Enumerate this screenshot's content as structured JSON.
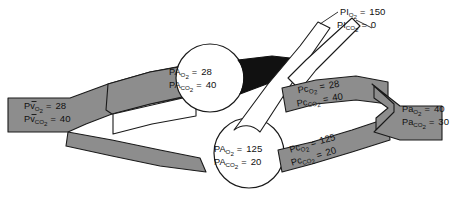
{
  "figure": {
    "colors": {
      "vessel_gray": "#8d8d8d",
      "vessel_gray_dark": "#777777",
      "airway_white": "#ffffff",
      "airway_blocked_black": "#111111",
      "outline": "#1a1a1a",
      "background": "#ffffff"
    }
  },
  "labels": {
    "inspired": {
      "name": "inspired-gas",
      "lines": [
        {
          "symbol": "PI",
          "sub": "O",
          "sub2": "2",
          "eq": "=",
          "value": "150"
        },
        {
          "symbol": "PI",
          "sub": "CO",
          "sub2": "2",
          "eq": "=",
          "value": "0"
        }
      ],
      "line1_symbol": "PI",
      "line1_sub": "O",
      "line1_sub2": "2",
      "line1_eq": "=",
      "line1_value": "150",
      "line2_symbol": "PI",
      "line2_sub": "CO",
      "line2_sub2": "2",
      "line2_eq": "=",
      "line2_value": "0"
    },
    "venous": {
      "name": "mixed-venous-blood",
      "line1_symbol": "Pv",
      "line1_bar": "̄",
      "line1_sub": "O",
      "line1_sub2": "2",
      "line1_eq": "=",
      "line1_value": "28",
      "line2_symbol": "Pv",
      "line2_bar": "̄",
      "line2_sub": "CO",
      "line2_sub2": "2",
      "line2_eq": "=",
      "line2_value": "40"
    },
    "alveolus_top": {
      "name": "alveolar-gas-upper-unit",
      "line1_symbol": "PA",
      "line1_sub": "O",
      "line1_sub2": "2",
      "line1_eq": "=",
      "line1_value": "28",
      "line2_symbol": "PA",
      "line2_sub": "CO",
      "line2_sub2": "2",
      "line2_eq": "=",
      "line2_value": "40"
    },
    "alveolus_bottom": {
      "name": "alveolar-gas-lower-unit",
      "line1_symbol": "PA",
      "line1_sub": "O",
      "line1_sub2": "2",
      "line1_eq": "=",
      "line1_value": "125",
      "line2_symbol": "PA",
      "line2_sub": "CO",
      "line2_sub2": "2",
      "line2_eq": "=",
      "line2_value": "20"
    },
    "capillary_top": {
      "name": "end-capillary-blood-upper-unit",
      "line1_symbol": "Pc",
      "line1_sub": "O",
      "line1_sub2": "2",
      "line1_eq": "=",
      "line1_value": "28",
      "line2_symbol": "Pc",
      "line2_sub": "CO",
      "line2_sub2": "2",
      "line2_eq": "=",
      "line2_value": "40"
    },
    "capillary_bottom": {
      "name": "end-capillary-blood-lower-unit",
      "line1_symbol": "Pc",
      "line1_sub": "O",
      "line1_sub2": "2",
      "line1_eq": "=",
      "line1_value": "125",
      "line2_symbol": "Pc",
      "line2_sub": "CO",
      "line2_sub2": "2",
      "line2_eq": "=",
      "line2_value": "20"
    },
    "arterial": {
      "name": "systemic-arterial-blood",
      "line1_symbol": "Pa",
      "line1_sub": "O",
      "line1_sub2": "2",
      "line1_eq": "=",
      "line1_value": "40",
      "line2_symbol": "Pa",
      "line2_sub": "CO",
      "line2_sub2": "2",
      "line2_eq": "=",
      "line2_value": "30"
    }
  }
}
